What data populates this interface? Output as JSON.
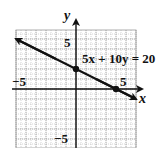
{
  "chart_data": {
    "type": "line",
    "title": "",
    "xlabel": "x",
    "ylabel": "y",
    "xlim": [
      -6,
      6
    ],
    "ylim": [
      -6,
      6
    ],
    "grid": true,
    "tick_labels": {
      "x": [
        {
          "value": -5,
          "label": "−5"
        },
        {
          "value": 5,
          "label": "5"
        }
      ],
      "y": [
        {
          "value": 5,
          "label": "5"
        },
        {
          "value": -5,
          "label": "−5"
        }
      ]
    },
    "series": [
      {
        "name": "5x + 10y = 20",
        "equation": "5x + 10y = 20",
        "x": [
          -6,
          0,
          4,
          6
        ],
        "y": [
          5,
          2,
          0,
          -1
        ],
        "marked_points": [
          {
            "x": 0,
            "y": 2
          },
          {
            "x": 4,
            "y": 0
          }
        ],
        "arrows_both_ends": true
      }
    ],
    "annotations": [
      {
        "text": "5x + 10y = 20",
        "x": 0.3,
        "y": 2.8
      }
    ]
  },
  "labels": {
    "x_axis": "x",
    "y_axis": "y",
    "equation": "5x + 10y = 20",
    "x_neg": "−5",
    "x_pos": "5",
    "y_pos": "5",
    "y_neg": "−5"
  },
  "colors": {
    "grid": "#9a9a9a",
    "axis": "#111111",
    "line": "#111111"
  }
}
